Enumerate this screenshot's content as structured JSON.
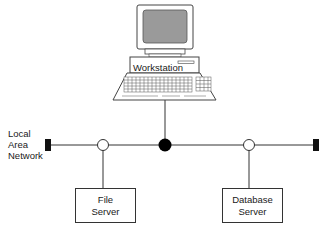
{
  "diagram": {
    "type": "network-topology",
    "network_label": {
      "line1": "Local",
      "line2": "Area",
      "line3": "Network"
    },
    "nodes": [
      {
        "id": "workstation",
        "label": "Workstation",
        "connector": "filled-circle"
      },
      {
        "id": "file_server",
        "label_line1": "File",
        "label_line2": "Server",
        "connector": "open-circle"
      },
      {
        "id": "database_server",
        "label_line1": "Database",
        "label_line2": "Server",
        "connector": "open-circle"
      }
    ],
    "terminators": [
      "left",
      "right"
    ],
    "colors": {
      "line": "#333333",
      "fill": "#000000",
      "screen": "#9a9a9a",
      "background": "#ffffff"
    }
  }
}
